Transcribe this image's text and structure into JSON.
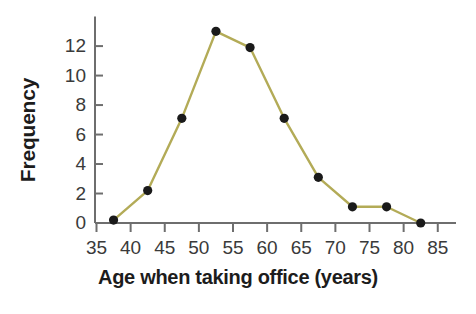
{
  "chart_data": {
    "type": "line",
    "title": "",
    "subtitle": "",
    "xlabel": "Age when taking office (years)",
    "ylabel": "Frequency",
    "x": [
      37.5,
      42.5,
      47.5,
      52.5,
      57.5,
      62.5,
      67.5,
      72.5,
      77.5,
      82.5
    ],
    "values": [
      0.2,
      2.2,
      7.1,
      13,
      11.9,
      7.1,
      3.1,
      1.1,
      1.1,
      0
    ],
    "series": [
      {
        "name": "Frequency of ages when taking office",
        "values": [
          0.2,
          2.2,
          7.1,
          13,
          11.9,
          7.1,
          3.1,
          1.1,
          1.1,
          0
        ]
      }
    ],
    "xlim": [
      35,
      86.5
    ],
    "ylim": [
      0,
      13.6
    ],
    "xticks": [
      35,
      40,
      45,
      50,
      55,
      60,
      65,
      70,
      75,
      80,
      85
    ],
    "xtick_labels": [
      "35",
      "40",
      "45",
      "50",
      "55",
      "60",
      "65",
      "70",
      "75",
      "80",
      "85"
    ],
    "yticks": [
      0,
      2,
      4,
      6,
      8,
      10,
      12
    ],
    "ytick_labels": [
      "0",
      "2",
      "4",
      "6",
      "8",
      "10",
      "12"
    ],
    "grid": false,
    "legend": false,
    "legend_position": "none",
    "marker": "filled-circle",
    "line_color": "#b3ab57",
    "marker_color": "#1a1a1a",
    "axis_color": "#6e6e6e",
    "background_color": "#ffffff",
    "annotations": []
  }
}
